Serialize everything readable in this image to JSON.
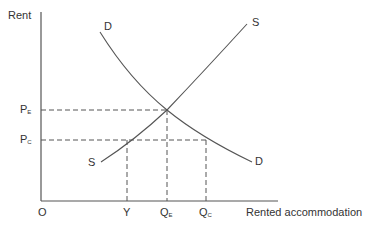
{
  "diagram": {
    "type": "supply-demand-rent-control",
    "y_axis_label": "Rent",
    "x_axis_label": "Rented accommodation",
    "origin_label": "O",
    "price_labels": [
      {
        "main": "P",
        "sub": "E"
      },
      {
        "main": "P",
        "sub": "C"
      }
    ],
    "quantity_labels": [
      {
        "main": "Y",
        "sub": ""
      },
      {
        "main": "Q",
        "sub": "E"
      },
      {
        "main": "Q",
        "sub": "C"
      }
    ],
    "curves": {
      "demand_top": "D",
      "demand_bottom": "D",
      "supply_top": "S",
      "supply_bottom": "S"
    },
    "colors": {
      "line": "#555555",
      "text": "#333333",
      "background": "#ffffff"
    }
  }
}
